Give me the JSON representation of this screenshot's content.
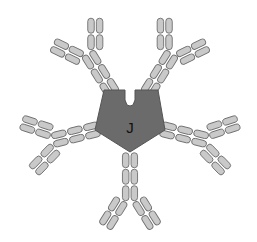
{
  "diagram": {
    "title": "",
    "type": "IgM pentamer schematic",
    "center": {
      "label": "J",
      "shape": "pentagon-with-notch",
      "color": "#6b6b6b"
    },
    "subunits": [
      {
        "name": "antibody-upper-left",
        "angle_deg": -122
      },
      {
        "name": "antibody-upper-right",
        "angle_deg": -58
      },
      {
        "name": "antibody-right",
        "angle_deg": 14
      },
      {
        "name": "antibody-bottom",
        "angle_deg": 90
      },
      {
        "name": "antibody-left",
        "angle_deg": 166
      }
    ],
    "segment_color": "#c9c9c9",
    "segment_outline": "#6e6e6e"
  }
}
